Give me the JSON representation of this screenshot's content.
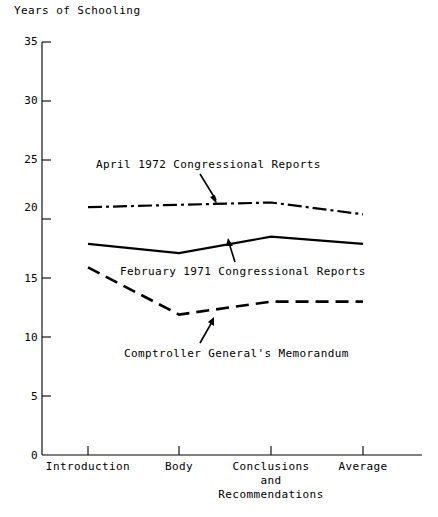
{
  "chart_data": {
    "type": "line",
    "title": "",
    "ylabel": "Years of Schooling",
    "xlabel": "",
    "ylim": [
      0,
      35
    ],
    "yticks": [
      0,
      5,
      10,
      15,
      20,
      25,
      30,
      35
    ],
    "grid": false,
    "legend": "inline-annotations",
    "categories": [
      "Introduction",
      "Body",
      "Conclusions\nand\nRecommendations",
      "Average"
    ],
    "series": [
      {
        "name": "April 1972 Congressional Reports",
        "style": "dash-dot",
        "values": [
          21.0,
          21.2,
          21.4,
          20.4
        ]
      },
      {
        "name": "February 1971 Congressional Reports",
        "style": "solid",
        "values": [
          17.9,
          17.1,
          18.5,
          17.9
        ]
      },
      {
        "name": "Comptroller General's Memorandum",
        "style": "dashed",
        "values": [
          15.9,
          11.9,
          13.0,
          13.0
        ]
      }
    ],
    "annotations": [
      {
        "text": "April 1972 Congressional Reports",
        "target_series": "April 1972 Congressional Reports"
      },
      {
        "text": "February 1971 Congressional Reports",
        "target_series": "February 1971 Congressional Reports"
      },
      {
        "text": "Comptroller General's Memorandum",
        "target_series": "Comptroller General's Memorandum"
      }
    ]
  },
  "axis": {
    "y_title": "Years of Schooling",
    "y_ticks": [
      "35",
      "30",
      "25",
      "20",
      "15",
      "10",
      "5",
      "0"
    ],
    "x_ticks": [
      "Introduction",
      "Body",
      "Conclusions\nand\nRecommendations",
      "Average"
    ]
  },
  "annotations": {
    "april": "April 1972 Congressional Reports",
    "february": "February 1971 Congressional Reports",
    "comptroller": "Comptroller General's Memorandum"
  },
  "colors": {
    "ink": "#000000",
    "background": "#ffffff"
  }
}
